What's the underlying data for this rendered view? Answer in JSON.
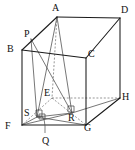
{
  "figure": {
    "shape": "cube",
    "colors": {
      "visible_edge": "#1a1a1a",
      "hidden_edge": "#6b6b6b",
      "cevian": "#4a4a4a",
      "label": "#111111",
      "background": "#ffffff"
    },
    "vertex_labels": [
      {
        "id": "A",
        "text": "A",
        "x": 52,
        "y": 3
      },
      {
        "id": "D",
        "text": "D",
        "x": 121,
        "y": 5
      },
      {
        "id": "P",
        "text": "P",
        "x": 24,
        "y": 29
      },
      {
        "id": "B",
        "text": "B",
        "x": 7,
        "y": 44
      },
      {
        "id": "C",
        "text": "C",
        "x": 88,
        "y": 49
      },
      {
        "id": "E",
        "text": "E",
        "x": 44,
        "y": 88
      },
      {
        "id": "H",
        "text": "H",
        "x": 122,
        "y": 92
      },
      {
        "id": "S",
        "text": "S",
        "x": 24,
        "y": 108
      },
      {
        "id": "R",
        "text": "R",
        "x": 68,
        "y": 113
      },
      {
        "id": "F",
        "text": "F",
        "x": 5,
        "y": 121
      },
      {
        "id": "G",
        "text": "G",
        "x": 84,
        "y": 123
      },
      {
        "id": "Q",
        "text": "Q",
        "x": 42,
        "y": 136
      }
    ],
    "vertex_points": {
      "A": [
        57,
        17
      ],
      "B": [
        22,
        50
      ],
      "C": [
        86,
        58
      ],
      "D": [
        120,
        18
      ],
      "E": [
        52,
        98
      ],
      "F": [
        22,
        125
      ],
      "G": [
        86,
        125
      ],
      "H": [
        120,
        98
      ],
      "P": [
        31,
        39
      ],
      "Q": [
        45,
        120
      ],
      "R": [
        72,
        113
      ],
      "S": [
        37,
        117
      ]
    },
    "visible_edges": [
      [
        "A",
        "D"
      ],
      [
        "A",
        "B"
      ],
      [
        "B",
        "C"
      ],
      [
        "C",
        "D"
      ],
      [
        "B",
        "F"
      ],
      [
        "C",
        "G"
      ],
      [
        "D",
        "H"
      ],
      [
        "F",
        "G"
      ],
      [
        "G",
        "H"
      ]
    ],
    "hidden_edges": [
      [
        "A",
        "E"
      ],
      [
        "E",
        "F"
      ],
      [
        "E",
        "G"
      ],
      [
        "E",
        "H"
      ]
    ],
    "construction_lines": [
      [
        "A",
        "S"
      ],
      [
        "A",
        "R"
      ],
      [
        "P",
        "S"
      ],
      [
        "P",
        "R"
      ],
      [
        "S",
        "R"
      ],
      [
        "F",
        "R"
      ],
      [
        "S",
        "G"
      ]
    ],
    "right_angle_marks": [
      "S",
      "R"
    ],
    "leader_lines": [
      {
        "from": "Q",
        "to_point": [
          43,
          114
        ]
      }
    ]
  }
}
